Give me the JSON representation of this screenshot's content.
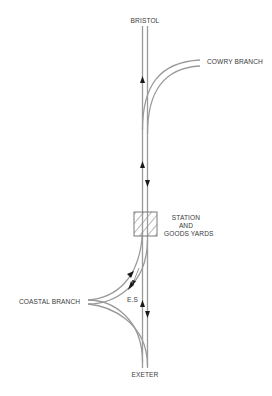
{
  "diagram": {
    "type": "railway-track-schematic",
    "labels": {
      "north_terminus": "BRISTOL",
      "south_terminus": "EXETER",
      "branch_east": "COWRY BRANCH",
      "branch_west": "COASTAL BRANCH",
      "station_line1": "STATION",
      "station_line2": "AND",
      "station_line3": "GOODS YARDS",
      "spur": "E.S"
    },
    "colors": {
      "track": "#9a9a9a",
      "arrow": "#1a1a1a",
      "station_box": "#7a7a7a",
      "hatch": "#8a8a8a",
      "text": "#3a3a3a",
      "background": "#ffffff"
    },
    "arrows": [
      {
        "location": "main line upper, west rail",
        "direction": "up"
      },
      {
        "location": "main line middle, west rail",
        "direction": "up"
      },
      {
        "location": "main line middle, east rail",
        "direction": "down"
      },
      {
        "location": "coastal curve, outer",
        "direction": "up-right"
      },
      {
        "location": "coastal curve, inner",
        "direction": "down-left"
      },
      {
        "location": "E.S spur",
        "direction": "down-left"
      },
      {
        "location": "main line lower, west rail",
        "direction": "up"
      },
      {
        "location": "main line lower, east rail",
        "direction": "down"
      }
    ]
  }
}
